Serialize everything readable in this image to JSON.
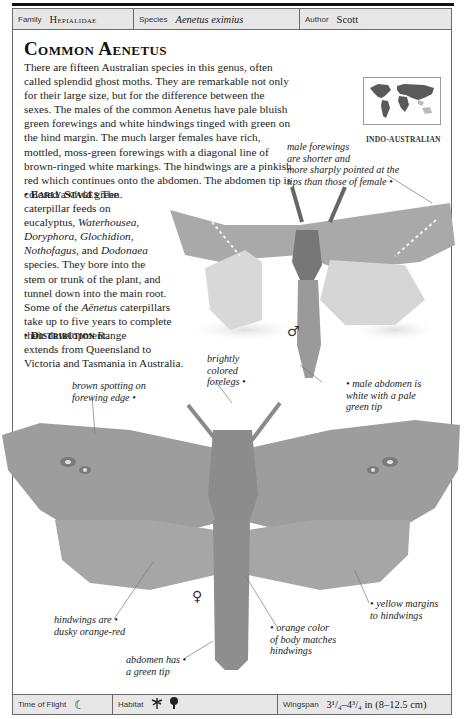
{
  "header": {
    "family_label": "Family",
    "family_value": "Hepialidae",
    "species_label": "Species",
    "species_value": "Aenetus eximius",
    "author_label": "Author",
    "author_value": "Scott"
  },
  "title": "Common Aenetus",
  "description": "There are fifteen Australian species in this genus, often called splendid ghost moths. They are remarkable not only for their large size, but for the difference between the sexes. The males of the common Aenetus have pale bluish green forewings and white hindwings tinged with green on the hind margin. The much larger females have rich, mottled, moss-green forewings with a diagonal line of brown-ringed white markings. The hindwings are a pinkish red which continues onto the abdomen. The abdomen tip is colored a vivid green.",
  "early_stages": {
    "bullet": "•",
    "heading": "Early Stages",
    "lines": [
      "The",
      "caterpillar feeds on",
      "eucalyptus, ",
      "Waterhousea",
      "Doryphora",
      "Glochidion",
      "Nothofagus",
      "Dodonaea",
      "species. They bore into the",
      "stem or trunk of the plant, and",
      "tunnel down into the main root.",
      "Some of the ",
      "Aënetus",
      " caterpillars",
      "take up to five years to complete",
      "their development."
    ],
    "sep_comma": ", ",
    "sep_and": ", and ",
    "sep_space": " "
  },
  "distribution": {
    "bullet": "•",
    "heading": "Distribution",
    "line1": "Range",
    "line2": "extends from Queensland to",
    "line3": "Victoria and Tasmania in Australia."
  },
  "map": {
    "region_label": "INDO-AUSTRALIAN",
    "icon": "world-map-icon"
  },
  "annotations": {
    "male_forewings": [
      "male forewings",
      "are shorter and",
      "more sharply pointed at the",
      "tips than those of female"
    ],
    "brightly_colored": [
      "brightly",
      "colored",
      "forelegs"
    ],
    "brown_spotting": [
      "brown spotting on",
      "forewing edge"
    ],
    "male_abdomen": [
      "male abdomen is",
      "white with a pale",
      "green tip"
    ],
    "hindwings": [
      "hindwings are",
      "dusky orange-red"
    ],
    "orange_color": [
      "orange color",
      "of body matches",
      "hindwings"
    ],
    "yellow_margins": [
      "yellow margins",
      "to hindwings"
    ],
    "abdomen_tip": [
      "abdomen has",
      "a green tip"
    ]
  },
  "symbols": {
    "male": "♂",
    "female": "♀"
  },
  "footer": {
    "time_label": "Time of Flight",
    "time_icon": "☾",
    "habitat_label": "Habitat",
    "habitat_icons": [
      "palm-tree-icon",
      "deciduous-tree-icon"
    ],
    "wingspan_label": "Wingspan",
    "wingspan_value": "3¹/₄–4³/₄ in (8–12.5 cm)"
  }
}
